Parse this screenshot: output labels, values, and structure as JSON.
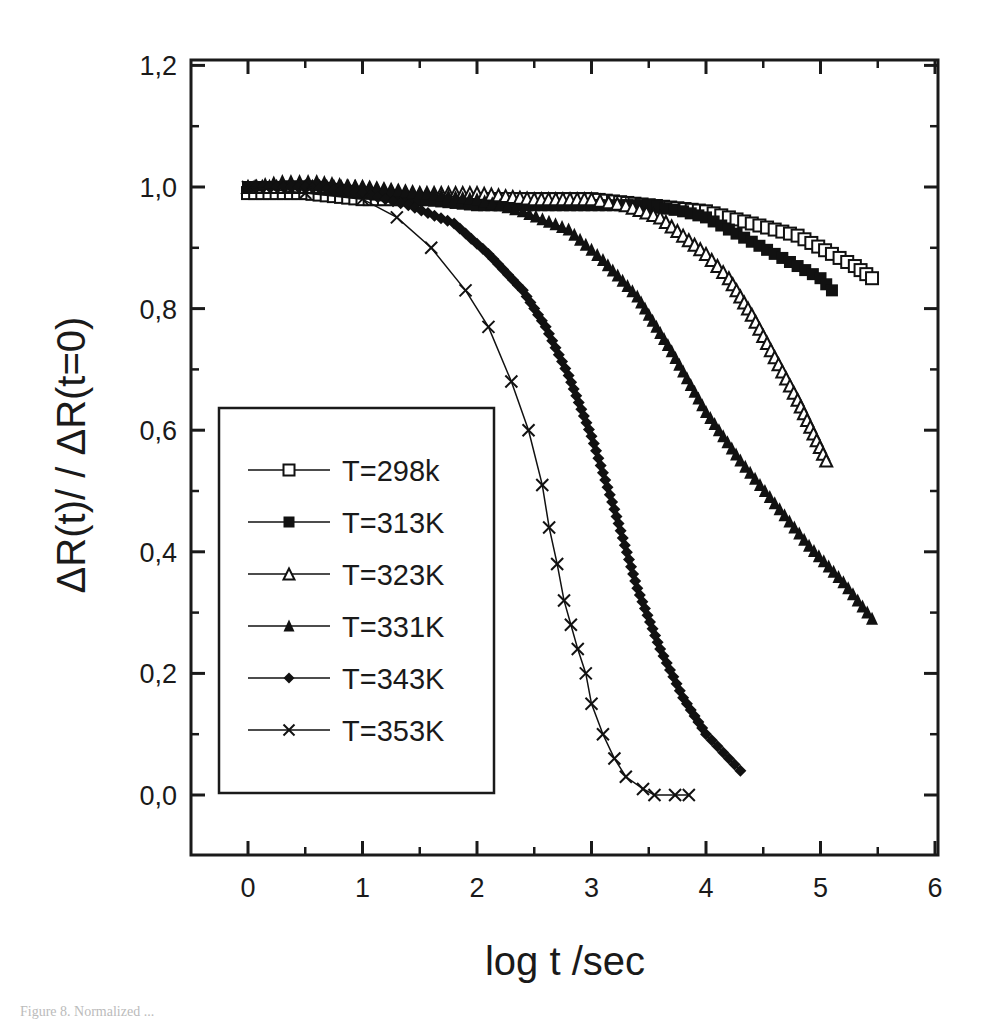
{
  "chart_data": {
    "type": "scatter",
    "title": "",
    "xlabel": "log t /sec",
    "ylabel": "ΔR(t)/ / ΔR(t=0)",
    "xlim": [
      -0.5,
      6
    ],
    "ylim": [
      -0.1,
      1.2
    ],
    "x_ticks": [
      0,
      1,
      2,
      3,
      4,
      5,
      6
    ],
    "x_tick_labels": [
      "0",
      "1",
      "2",
      "3",
      "4",
      "5",
      "6"
    ],
    "y_ticks": [
      0.0,
      0.2,
      0.4,
      0.6,
      0.8,
      1.0,
      1.2
    ],
    "y_tick_labels": [
      "0,0",
      "0,2",
      "0,4",
      "0,6",
      "0,8",
      "1,0",
      "1,2"
    ],
    "grid": false,
    "legend_position": "lower-left inside",
    "series": [
      {
        "name": "T=298k",
        "marker": "open-square",
        "x": [
          0,
          0.5,
          1.0,
          1.5,
          2.0,
          2.5,
          3.0,
          3.5,
          4.0,
          4.4,
          4.8,
          5.1,
          5.3,
          5.45
        ],
        "y": [
          0.99,
          0.99,
          0.98,
          0.98,
          0.98,
          0.98,
          0.98,
          0.97,
          0.96,
          0.94,
          0.92,
          0.89,
          0.87,
          0.85
        ]
      },
      {
        "name": "T=313K",
        "marker": "filled-square",
        "x": [
          0,
          0.5,
          1.0,
          1.5,
          2.0,
          2.5,
          3.0,
          3.5,
          3.8,
          4.0,
          4.2,
          4.4,
          4.6,
          4.8,
          5.0,
          5.1
        ],
        "y": [
          1.0,
          1.0,
          0.99,
          0.98,
          0.97,
          0.97,
          0.97,
          0.97,
          0.96,
          0.95,
          0.93,
          0.91,
          0.89,
          0.87,
          0.85,
          0.83
        ]
      },
      {
        "name": "T=323K",
        "marker": "open-triangle",
        "x": [
          0,
          0.5,
          1.0,
          1.5,
          2.0,
          2.5,
          3.0,
          3.3,
          3.6,
          3.8,
          4.0,
          4.2,
          4.4,
          4.6,
          4.8,
          5.05
        ],
        "y": [
          1.0,
          1.0,
          1.0,
          0.99,
          0.99,
          0.98,
          0.98,
          0.97,
          0.95,
          0.92,
          0.89,
          0.85,
          0.79,
          0.72,
          0.65,
          0.55
        ]
      },
      {
        "name": "T=331K",
        "marker": "filled-triangle",
        "x": [
          0,
          0.3,
          0.6,
          1.0,
          1.5,
          2.0,
          2.4,
          2.8,
          3.1,
          3.4,
          3.7,
          4.0,
          4.3,
          4.6,
          4.9,
          5.2,
          5.45
        ],
        "y": [
          1.0,
          1.01,
          1.01,
          1.0,
          0.99,
          0.98,
          0.96,
          0.93,
          0.88,
          0.82,
          0.73,
          0.63,
          0.55,
          0.48,
          0.41,
          0.35,
          0.29
        ]
      },
      {
        "name": "T=343K",
        "marker": "filled-diamond",
        "x": [
          0,
          0.5,
          1.0,
          1.4,
          1.8,
          2.1,
          2.4,
          2.6,
          2.8,
          3.0,
          3.2,
          3.4,
          3.6,
          3.8,
          4.0,
          4.2,
          4.3
        ],
        "y": [
          1.0,
          1.0,
          0.99,
          0.97,
          0.94,
          0.89,
          0.83,
          0.77,
          0.69,
          0.59,
          0.47,
          0.34,
          0.24,
          0.16,
          0.1,
          0.06,
          0.04
        ]
      },
      {
        "name": "T=353K",
        "marker": "cross",
        "x": [
          0,
          0.5,
          1.0,
          1.3,
          1.6,
          1.9,
          2.1,
          2.3,
          2.45,
          2.57,
          2.63,
          2.7,
          2.76,
          2.82,
          2.88,
          2.95,
          3.0,
          3.1,
          3.2,
          3.3,
          3.45,
          3.55,
          3.73,
          3.85
        ],
        "y": [
          1.0,
          0.99,
          0.98,
          0.95,
          0.9,
          0.83,
          0.77,
          0.68,
          0.6,
          0.51,
          0.44,
          0.38,
          0.32,
          0.28,
          0.24,
          0.2,
          0.15,
          0.1,
          0.06,
          0.03,
          0.01,
          0.0,
          0.0,
          0.0
        ]
      }
    ]
  },
  "caption_fragment": "Figure 8. Normalized ..."
}
